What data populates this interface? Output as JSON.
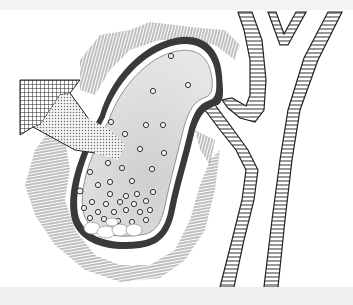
{
  "figure": {
    "width": 353,
    "height": 305,
    "colors": {
      "background": "#ffffff",
      "frame_band": "#efefef",
      "wall_dark": "#444444",
      "bile_fill": "#d9d9d9",
      "hatching": "#9a9a9a",
      "duct_stroke": "#333333"
    },
    "elements": [
      {
        "name": "gallbladder",
        "label": ""
      },
      {
        "name": "gallstones",
        "label": ""
      },
      {
        "name": "cystic-duct",
        "label": ""
      },
      {
        "name": "common-bile-duct",
        "label": ""
      },
      {
        "name": "hepatic-ducts",
        "label": ""
      },
      {
        "name": "inflammation-hatching",
        "label": ""
      },
      {
        "name": "pointer-arrow",
        "label": ""
      }
    ]
  }
}
